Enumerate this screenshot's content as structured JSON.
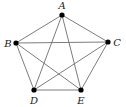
{
  "diagram": {
    "type": "complete-graph",
    "name": "K5",
    "vertices": [
      {
        "id": "A",
        "label": "A",
        "x": 62,
        "y": 15,
        "lx": 62,
        "ly": 9
      },
      {
        "id": "B",
        "label": "B",
        "x": 16,
        "y": 43,
        "lx": 8,
        "ly": 46.5
      },
      {
        "id": "C",
        "label": "C",
        "x": 108,
        "y": 42,
        "lx": 117,
        "ly": 45.5
      },
      {
        "id": "D",
        "label": "D",
        "x": 34,
        "y": 90,
        "lx": 34,
        "ly": 104
      },
      {
        "id": "E",
        "label": "E",
        "x": 81,
        "y": 90,
        "lx": 81,
        "ly": 104
      }
    ],
    "edges": [
      [
        "A",
        "B"
      ],
      [
        "A",
        "C"
      ],
      [
        "A",
        "D"
      ],
      [
        "A",
        "E"
      ],
      [
        "B",
        "C"
      ],
      [
        "B",
        "D"
      ],
      [
        "B",
        "E"
      ],
      [
        "C",
        "D"
      ],
      [
        "C",
        "E"
      ],
      [
        "D",
        "E"
      ]
    ]
  }
}
